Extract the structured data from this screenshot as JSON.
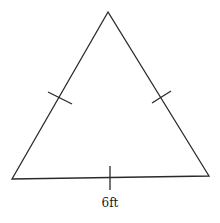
{
  "diagram": {
    "type": "equilateral-triangle",
    "vertices": {
      "apex": [
        108,
        12
      ],
      "bottom_left": [
        12,
        179
      ],
      "bottom_right": [
        209,
        176
      ]
    },
    "congruence_ticks": [
      {
        "side": "left",
        "from": [
          48,
          92
        ],
        "to": [
          72,
          104
        ]
      },
      {
        "side": "right",
        "from": [
          152,
          103
        ],
        "to": [
          171,
          91
        ]
      },
      {
        "side": "bottom",
        "from": [
          110,
          166
        ],
        "to": [
          110,
          190
        ]
      }
    ],
    "labels": {
      "base_length": "6ft"
    },
    "colors": {
      "stroke": "#2a2a2a",
      "background": "#ffffff"
    }
  }
}
